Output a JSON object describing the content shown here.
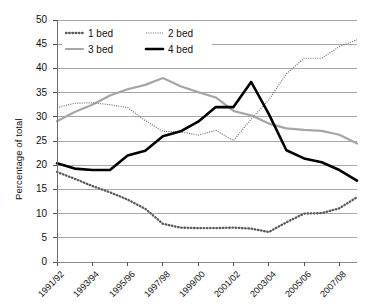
{
  "chart_data": {
    "type": "line",
    "title": "",
    "xlabel": "",
    "ylabel": "Percentage of total",
    "ylim": [
      0,
      50
    ],
    "ytick_step": 5,
    "yticks": [
      0,
      5,
      10,
      15,
      20,
      25,
      30,
      35,
      40,
      45,
      50
    ],
    "grid": true,
    "legend_position": "top-left-inside",
    "x": [
      "1991/92",
      "1992/93",
      "1993/94",
      "1994/95",
      "1995/96",
      "1996/97",
      "1997/98",
      "1998/99",
      "1999/00",
      "2000/01",
      "2001/02",
      "2002/03",
      "2003/04",
      "2004/05",
      "2005/06",
      "2006/07",
      "2007/08",
      "2008/09"
    ],
    "xtick_labels": [
      "1991/92",
      "1993/94",
      "1995/96",
      "1997/98",
      "1999/00",
      "2001/02",
      "2003/04",
      "2005/06",
      "2007/08"
    ],
    "series": [
      {
        "name": "1 bed",
        "style": "dotted-thick",
        "color": "#595959",
        "values": [
          18.6,
          17.2,
          15.7,
          14.4,
          12.9,
          11.0,
          7.9,
          7.1,
          7.0,
          7.0,
          7.1,
          6.9,
          6.2,
          8.2,
          10.0,
          10.1,
          11.1,
          13.4
        ]
      },
      {
        "name": "2 bed",
        "style": "dotted-fine",
        "color": "#6e6e6e",
        "values": [
          31.9,
          32.8,
          32.9,
          32.5,
          31.9,
          29.2,
          27.0,
          26.9,
          26.2,
          27.2,
          25.1,
          29.5,
          33.5,
          38.9,
          42.1,
          42.1,
          44.5,
          45.9
        ]
      },
      {
        "name": "3 bed",
        "style": "solid-gray",
        "color": "#a6a6a6",
        "values": [
          29.1,
          31.0,
          32.5,
          34.4,
          35.7,
          36.6,
          38.0,
          36.3,
          35.1,
          34.0,
          31.2,
          30.3,
          28.6,
          27.6,
          27.3,
          27.1,
          26.3,
          24.5
        ]
      },
      {
        "name": "4 bed",
        "style": "solid-black",
        "color": "#000000",
        "values": [
          20.4,
          19.3,
          19.0,
          19.0,
          22.0,
          23.0,
          26.0,
          27.0,
          29.0,
          32.0,
          32.0,
          37.2,
          30.6,
          23.1,
          21.4,
          20.6,
          19.0,
          16.8
        ]
      }
    ],
    "legend": [
      {
        "label": "1 bed"
      },
      {
        "label": "2 bed"
      },
      {
        "label": "3 bed"
      },
      {
        "label": "4 bed"
      }
    ]
  }
}
